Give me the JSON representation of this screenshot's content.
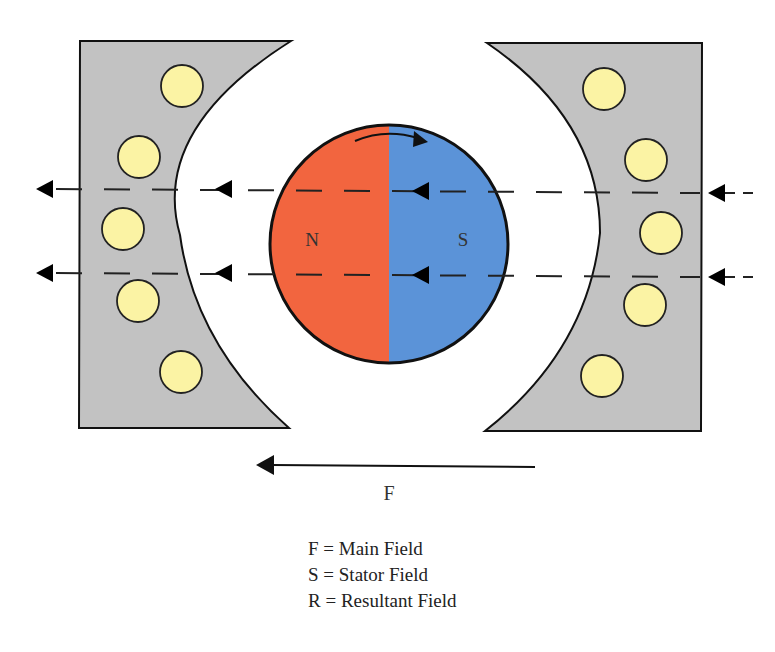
{
  "diagram": {
    "rotor": {
      "north_label": "N",
      "south_label": "S",
      "north_color": "#f2653f",
      "south_color": "#5b93d8"
    },
    "stator_color": "#c2c2c2",
    "conductor_color": "#fbf3a4",
    "main_field_arrow_label": "F"
  },
  "legend": [
    "F = Main Field",
    "S = Stator Field",
    "R = Resultant Field"
  ]
}
